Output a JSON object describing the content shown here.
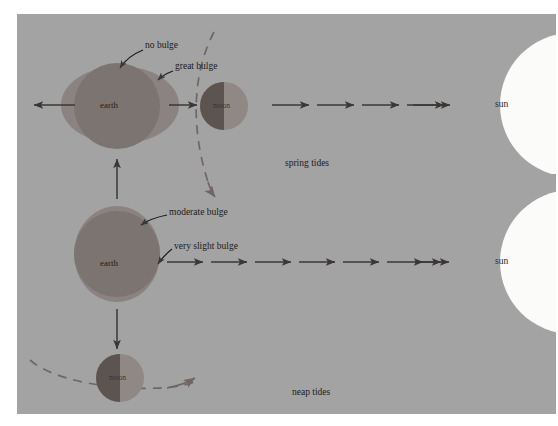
{
  "figure": {
    "background_color": "#a3a3a3",
    "page_color": "#ffffff"
  },
  "colors": {
    "panel_bg": "#a3a3a3",
    "earth_fill": "#7b7471",
    "earth_bulge_fill": "#8a8381",
    "moon_dark": "#5d5450",
    "moon_light": "#8f8884",
    "sun_fill": "#fbfbfa",
    "arrow": "#3b3734",
    "orbit_dash": "#6f6763",
    "text": "#1b1b1b"
  },
  "rows": [
    {
      "id": "spring-tides-row",
      "caption": "spring tides",
      "earth_label": "earth",
      "moon_label": "moon",
      "sun_label": "sun",
      "callouts": [
        {
          "id": "no-bulge",
          "text": "no bulge"
        },
        {
          "id": "great-bulge",
          "text": "great bulge"
        }
      ],
      "arrow_count_to_sun": 5,
      "left_arrow": {
        "id": "left-pull-arrow",
        "direction": "left",
        "count": 1
      }
    },
    {
      "id": "neap-tides-row",
      "caption": "neap tides",
      "earth_label": "earth",
      "moon_label": "moon",
      "sun_label": "sun",
      "callouts": [
        {
          "id": "moderate-bulge",
          "text": "moderate bulge"
        },
        {
          "id": "very-slight-bulge",
          "text": "very slight bulge"
        }
      ],
      "arrow_count_to_sun": 8
    }
  ],
  "connectors": [
    {
      "id": "orbit-arrow-up",
      "direction": "up"
    },
    {
      "id": "orbit-arrow-down",
      "direction": "down"
    }
  ],
  "captions": {
    "spring_tides": "spring tides",
    "neap_tides": "neap tides"
  },
  "labels": {
    "earth": "earth",
    "moon": "moon",
    "sun": "sun",
    "no_bulge": "no bulge",
    "great_bulge": "great bulge",
    "moderate_bulge": "moderate bulge",
    "very_slight_bulge": "very slight bulge"
  }
}
